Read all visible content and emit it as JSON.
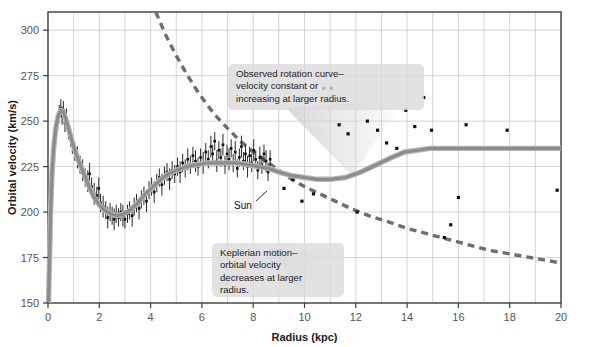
{
  "figure": {
    "name": "galactic-rotation-curve",
    "background": "#ffffff",
    "frame_color": "#3b3b3b",
    "grid_color": "#c9c9c9"
  },
  "chart_data": {
    "type": "line",
    "title": "",
    "xlabel": "Radius (kpc)",
    "ylabel": "Orbital velocity (km/s)",
    "xlim": [
      0,
      20
    ],
    "ylim": [
      150,
      310
    ],
    "grid": true,
    "legend_position": "none",
    "x_ticks": [
      0,
      2,
      4,
      6,
      8,
      10,
      12,
      14,
      16,
      18,
      20
    ],
    "x_tick_labels": [
      "0",
      "2",
      "4",
      "6",
      "8",
      "10",
      "12",
      "14",
      "16",
      "18",
      "20"
    ],
    "x_minor_ticks": [
      1,
      3,
      5,
      7,
      9,
      11,
      13,
      15,
      17,
      19
    ],
    "y_ticks": [
      150,
      175,
      200,
      225,
      250,
      275,
      300
    ],
    "y_tick_labels": [
      "150",
      "175",
      "200",
      "225",
      "250",
      "275",
      "300"
    ],
    "series": [
      {
        "name": "Observed rotation curve (model fit)",
        "style": "solid",
        "color": "#8c8c8c",
        "width": 3.2,
        "points": [
          [
            0.02,
            150
          ],
          [
            0.06,
            175
          ],
          [
            0.1,
            200
          ],
          [
            0.16,
            222
          ],
          [
            0.22,
            235
          ],
          [
            0.3,
            246
          ],
          [
            0.4,
            253
          ],
          [
            0.5,
            256
          ],
          [
            0.6,
            255
          ],
          [
            0.72,
            250
          ],
          [
            0.86,
            243
          ],
          [
            1.0,
            236
          ],
          [
            1.2,
            228
          ],
          [
            1.4,
            221
          ],
          [
            1.6,
            214
          ],
          [
            1.8,
            208
          ],
          [
            2.0,
            204
          ],
          [
            2.2,
            201
          ],
          [
            2.45,
            199
          ],
          [
            2.7,
            198
          ],
          [
            2.95,
            199
          ],
          [
            3.2,
            201
          ],
          [
            3.5,
            205
          ],
          [
            3.8,
            210
          ],
          [
            4.1,
            214
          ],
          [
            4.4,
            218
          ],
          [
            4.7,
            221
          ],
          [
            5.0,
            223
          ],
          [
            5.4,
            225
          ],
          [
            5.8,
            226
          ],
          [
            6.2,
            227
          ],
          [
            6.6,
            227
          ],
          [
            7.0,
            227
          ],
          [
            7.4,
            227
          ],
          [
            7.8,
            226
          ],
          [
            8.2,
            225
          ],
          [
            8.6,
            224
          ],
          [
            9.0,
            222
          ],
          [
            9.5,
            220
          ],
          [
            10.0,
            219
          ],
          [
            10.5,
            218
          ],
          [
            11.0,
            218
          ],
          [
            11.6,
            219
          ],
          [
            12.2,
            222
          ],
          [
            12.8,
            226
          ],
          [
            13.4,
            230
          ],
          [
            13.9,
            233
          ],
          [
            14.4,
            234
          ],
          [
            14.9,
            235
          ],
          [
            15.6,
            235
          ],
          [
            16.5,
            235
          ],
          [
            17.5,
            235
          ],
          [
            18.5,
            235
          ],
          [
            19.5,
            235
          ],
          [
            20.0,
            235
          ]
        ]
      },
      {
        "name": "Keplerian motion prediction",
        "style": "dashed",
        "color": "#6e6e6e",
        "width": 3.4,
        "dash": "7,5",
        "points": [
          [
            4.2,
            310
          ],
          [
            4.6,
            297
          ],
          [
            5.0,
            286
          ],
          [
            5.4,
            276
          ],
          [
            5.8,
            267
          ],
          [
            6.2,
            259
          ],
          [
            6.6,
            252
          ],
          [
            7.0,
            246
          ],
          [
            7.5,
            239
          ],
          [
            8.0,
            233
          ],
          [
            8.5,
            228
          ],
          [
            9.0,
            223
          ],
          [
            9.5,
            218
          ],
          [
            10.0,
            214
          ],
          [
            10.6,
            210
          ],
          [
            11.2,
            206
          ],
          [
            11.8,
            202
          ],
          [
            12.5,
            198
          ],
          [
            13.2,
            195
          ],
          [
            14.0,
            191
          ],
          [
            14.8,
            188
          ],
          [
            15.6,
            185
          ],
          [
            16.4,
            182
          ],
          [
            17.2,
            179
          ],
          [
            18.0,
            177
          ],
          [
            18.8,
            175
          ],
          [
            19.6,
            173
          ],
          [
            20.0,
            172
          ]
        ]
      }
    ],
    "scatter": {
      "name": "Measured HI / CO tracer velocities",
      "marker": "square",
      "color": "#111111",
      "size": 2.6,
      "inner_points_with_errorbars": [
        [
          0.18,
          222,
          6
        ],
        [
          0.25,
          237,
          5
        ],
        [
          0.32,
          243,
          6
        ],
        [
          0.38,
          250,
          5
        ],
        [
          0.44,
          254,
          5
        ],
        [
          0.5,
          257,
          5
        ],
        [
          0.55,
          253,
          5
        ],
        [
          0.6,
          256,
          5
        ],
        [
          0.66,
          249,
          5
        ],
        [
          0.72,
          251,
          6
        ],
        [
          0.8,
          245,
          5
        ],
        [
          0.88,
          241,
          5
        ],
        [
          0.95,
          237,
          5
        ],
        [
          1.05,
          233,
          5
        ],
        [
          1.15,
          230,
          6
        ],
        [
          1.25,
          226,
          5
        ],
        [
          1.35,
          223,
          6
        ],
        [
          1.45,
          219,
          5
        ],
        [
          1.55,
          217,
          6
        ],
        [
          1.62,
          221,
          6
        ],
        [
          1.7,
          214,
          5
        ],
        [
          1.8,
          210,
          6
        ],
        [
          1.9,
          209,
          5
        ],
        [
          1.98,
          213,
          6
        ],
        [
          2.05,
          205,
          5
        ],
        [
          2.15,
          203,
          6
        ],
        [
          2.25,
          201,
          5
        ],
        [
          2.33,
          197,
          6
        ],
        [
          2.42,
          200,
          5
        ],
        [
          2.5,
          198,
          5
        ],
        [
          2.58,
          196,
          6
        ],
        [
          2.66,
          199,
          5
        ],
        [
          2.75,
          197,
          5
        ],
        [
          2.84,
          200,
          5
        ],
        [
          2.92,
          198,
          6
        ],
        [
          3.0,
          196,
          5
        ],
        [
          3.1,
          199,
          5
        ],
        [
          3.18,
          201,
          5
        ],
        [
          3.28,
          198,
          6
        ],
        [
          3.36,
          203,
          5
        ],
        [
          3.45,
          205,
          5
        ],
        [
          3.55,
          202,
          6
        ],
        [
          3.64,
          207,
          5
        ],
        [
          3.74,
          209,
          5
        ],
        [
          3.84,
          206,
          6
        ],
        [
          3.94,
          212,
          5
        ],
        [
          4.04,
          214,
          5
        ],
        [
          4.14,
          211,
          6
        ],
        [
          4.24,
          216,
          5
        ],
        [
          4.34,
          219,
          5
        ],
        [
          4.44,
          215,
          6
        ],
        [
          4.54,
          220,
          5
        ],
        [
          4.64,
          222,
          5
        ],
        [
          4.74,
          218,
          6
        ],
        [
          4.84,
          223,
          5
        ],
        [
          4.94,
          221,
          5
        ],
        [
          5.05,
          225,
          5
        ],
        [
          5.15,
          222,
          6
        ],
        [
          5.25,
          227,
          5
        ],
        [
          5.35,
          224,
          5
        ],
        [
          5.45,
          229,
          6
        ],
        [
          5.55,
          226,
          5
        ],
        [
          5.65,
          231,
          5
        ],
        [
          5.75,
          228,
          6
        ],
        [
          5.85,
          225,
          5
        ],
        [
          5.95,
          230,
          5
        ],
        [
          6.05,
          227,
          6
        ],
        [
          6.15,
          233,
          5
        ],
        [
          6.25,
          229,
          5
        ],
        [
          6.35,
          236,
          6
        ],
        [
          6.42,
          232,
          5
        ],
        [
          6.5,
          239,
          5
        ],
        [
          6.58,
          228,
          6
        ],
        [
          6.66,
          234,
          5
        ],
        [
          6.74,
          230,
          5
        ],
        [
          6.82,
          237,
          6
        ],
        [
          6.9,
          226,
          5
        ],
        [
          6.98,
          232,
          5
        ],
        [
          7.06,
          229,
          6
        ],
        [
          7.14,
          235,
          5
        ],
        [
          7.22,
          227,
          5
        ],
        [
          7.3,
          233,
          6
        ],
        [
          7.38,
          224,
          5
        ],
        [
          7.46,
          230,
          5
        ],
        [
          7.54,
          236,
          6
        ],
        [
          7.62,
          228,
          5
        ],
        [
          7.7,
          232,
          5
        ],
        [
          7.78,
          225,
          6
        ],
        [
          7.86,
          231,
          5
        ],
        [
          7.94,
          227,
          5
        ],
        [
          8.02,
          234,
          6
        ],
        [
          8.1,
          229,
          5
        ],
        [
          8.18,
          223,
          5
        ],
        [
          8.26,
          230,
          6
        ],
        [
          8.34,
          226,
          5
        ],
        [
          8.42,
          232,
          5
        ],
        [
          8.5,
          228,
          6
        ],
        [
          8.58,
          222,
          5
        ],
        [
          8.66,
          229,
          5
        ]
      ],
      "outer_points": [
        [
          9.2,
          213
        ],
        [
          9.55,
          218
        ],
        [
          9.9,
          206
        ],
        [
          10.35,
          210
        ],
        [
          10.75,
          268
        ],
        [
          11.05,
          268
        ],
        [
          11.35,
          248
        ],
        [
          11.7,
          243
        ],
        [
          12.05,
          200
        ],
        [
          12.45,
          250
        ],
        [
          12.85,
          245
        ],
        [
          13.2,
          238
        ],
        [
          13.6,
          235
        ],
        [
          13.95,
          256
        ],
        [
          14.3,
          247
        ],
        [
          14.65,
          263
        ],
        [
          14.95,
          245
        ],
        [
          15.45,
          186
        ],
        [
          15.7,
          193
        ],
        [
          16.0,
          208
        ],
        [
          16.3,
          248
        ],
        [
          17.9,
          245
        ],
        [
          19.85,
          212
        ]
      ]
    },
    "annotations": [
      {
        "name": "observed-rotation-annotation",
        "lines": [
          "Observed rotation curve–",
          "velocity constant or",
          "increasing at larger radius."
        ],
        "box": {
          "x": 228,
          "y": 64,
          "width": 196,
          "height": 46
        },
        "pointer_target": [
          330,
          165
        ]
      },
      {
        "name": "keplerian-motion-annotation",
        "lines": [
          "Keplerian motion–",
          "orbital velocity",
          "decreases at larger",
          "radius."
        ],
        "box": {
          "x": 212,
          "y": 243,
          "width": 132,
          "height": 54
        },
        "pointer_target": [
          330,
          250
        ]
      }
    ],
    "point_labels": [
      {
        "name": "sun-marker-label",
        "text": "Sun",
        "label_x": 234,
        "label_y": 209,
        "target_x": 267,
        "target_y": 191,
        "radius_kpc": 8.3,
        "velocity_kms": 225
      }
    ]
  }
}
